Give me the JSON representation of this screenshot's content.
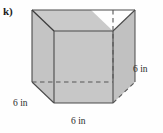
{
  "figure": {
    "part_label": "k)",
    "shape_name": "cube",
    "fill_color": "#c6c6c6",
    "top_face_color": "#c9c9c9",
    "right_face_color": "#c0c0c0",
    "edge_color": "#4a4a4a",
    "hidden_edge_color": "#5a5a5a",
    "background_color": "#fefefe",
    "labels": {
      "height": "6 in",
      "depth": "6 in",
      "width": "6 in"
    },
    "geometry": {
      "front_face": [
        [
          54,
          31
        ],
        [
          113,
          31
        ],
        [
          113,
          103
        ],
        [
          54,
          103
        ]
      ],
      "projection_offset": [
        -22,
        -21
      ],
      "visible_edges": [
        "front-top",
        "front-left",
        "front-right",
        "front-bottom",
        "top-left-diagonal",
        "top-right-diagonal",
        "bottom-left-diagonal",
        "back-top",
        "back-left",
        "back-right-vertical-lower"
      ],
      "hidden_edges": [
        "back-vertical-right",
        "back-bottom-horizontal",
        "bottom-right-diagonal"
      ]
    }
  }
}
